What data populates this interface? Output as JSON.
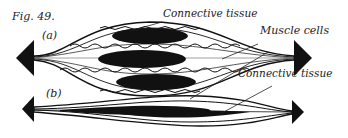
{
  "figure": {
    "title": "Fig. 49.",
    "panels": [
      {
        "id": "a",
        "label": "(a)"
      },
      {
        "id": "b",
        "label": "(b)"
      }
    ],
    "annotations": {
      "connective_tissue_top": "Connective tissue",
      "muscle_cells": "Muscle cells",
      "connective_tissue_bottom": "Connective tissue"
    },
    "colors": {
      "ink": "#111111",
      "text": "#222222",
      "background": "#ffffff"
    }
  }
}
